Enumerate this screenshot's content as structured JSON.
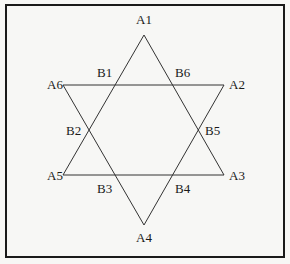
{
  "diagram": {
    "outer_vertices": [
      {
        "id": "A1",
        "x": 144,
        "y": 35
      },
      {
        "id": "A2",
        "x": 224,
        "y": 85
      },
      {
        "id": "A3",
        "x": 224,
        "y": 175
      },
      {
        "id": "A4",
        "x": 144,
        "y": 225
      },
      {
        "id": "A5",
        "x": 63,
        "y": 175
      },
      {
        "id": "A6",
        "x": 63,
        "y": 85
      }
    ],
    "inner_points": [
      "B1",
      "B2",
      "B3",
      "B4",
      "B5",
      "B6"
    ],
    "labels": {
      "A1": "A1",
      "A2": "A2",
      "A3": "A3",
      "A4": "A4",
      "A5": "A5",
      "A6": "A6",
      "B1": "B1",
      "B2": "B2",
      "B3": "B3",
      "B4": "B4",
      "B5": "B5",
      "B6": "B6"
    },
    "triangles": [
      [
        "A1",
        "A3",
        "A5"
      ],
      [
        "A2",
        "A4",
        "A6"
      ]
    ],
    "colors": {
      "line": "#333333",
      "border": "#1a1a1a",
      "background": "#f7f7f5"
    }
  }
}
